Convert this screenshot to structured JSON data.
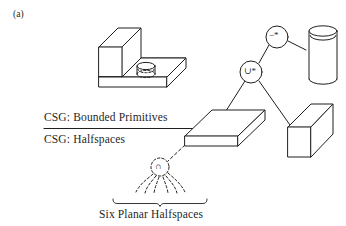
{
  "figure": {
    "panel_label": "(a)",
    "caption_bottom": "Six Planar Halfspaces",
    "background_color": "#ffffff",
    "ink_color": "#1f1f1f"
  },
  "divider": {
    "label_above": "CSG: Bounded Primitives",
    "label_below": "CSG: Halfspaces"
  },
  "tree": {
    "nodes": [
      {
        "id": "difference",
        "glyph": "−*",
        "name": "regularized-difference-node",
        "style": "solid-circle",
        "cx": 277,
        "cy": 37,
        "r": 11
      },
      {
        "id": "union",
        "glyph": "∪*",
        "name": "regularized-union-node",
        "style": "solid-circle",
        "cx": 251,
        "cy": 72,
        "r": 11
      },
      {
        "id": "intersection",
        "glyph": "∩",
        "name": "intersection-node",
        "style": "dashed-circle",
        "cx": 160,
        "cy": 167,
        "r": 9
      }
    ],
    "primitives": [
      {
        "id": "cylinder",
        "name": "cylinder-primitive"
      },
      {
        "id": "slab",
        "name": "slab-box-primitive"
      },
      {
        "id": "upright-box",
        "name": "upright-box-primitive"
      }
    ],
    "halfspace_count": 6
  },
  "solid": {
    "name": "l-shaped-solid-with-hole",
    "has_cylindrical_hole": true
  }
}
